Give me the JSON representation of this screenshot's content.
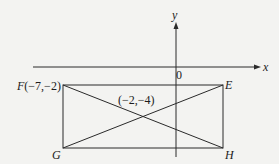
{
  "diagram": {
    "type": "coordinate-geometry",
    "axes": {
      "x_label": "x",
      "y_label": "y",
      "origin_label": "0"
    },
    "shape": "rectangle",
    "points": {
      "F": {
        "label": "F(−7,−2)",
        "name": "F",
        "coords": [
          -7,
          -2
        ]
      },
      "E": {
        "label": "E",
        "name": "E"
      },
      "G": {
        "label": "G",
        "name": "G"
      },
      "H": {
        "label": "H",
        "name": "H"
      }
    },
    "intersection": {
      "label": "(−2,−4)",
      "coords": [
        -2,
        -4
      ]
    },
    "diagonals": [
      "FH",
      "GE"
    ],
    "colors": {
      "background": "#f3f3f1",
      "ink": "#1c1c1c"
    }
  }
}
